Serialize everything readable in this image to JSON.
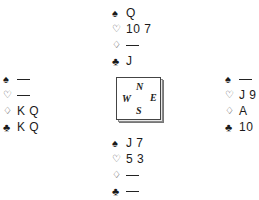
{
  "suits": {
    "spades": "♠",
    "hearts": "♡",
    "diamonds": "♢",
    "clubs": "♣"
  },
  "hands": {
    "north": {
      "spades": "Q",
      "hearts": "10 7",
      "diamonds": "—",
      "clubs": "J"
    },
    "west": {
      "spades": "—",
      "hearts": "—",
      "diamonds": "K Q",
      "clubs": "K Q"
    },
    "east": {
      "spades": "—",
      "hearts": "J 9",
      "diamonds": "A",
      "clubs": "10"
    },
    "south": {
      "spades": "J 7",
      "hearts": "5 3",
      "diamonds": "—",
      "clubs": "—"
    }
  },
  "compass": {
    "north": "N",
    "south": "S",
    "west": "W",
    "east": "E"
  }
}
